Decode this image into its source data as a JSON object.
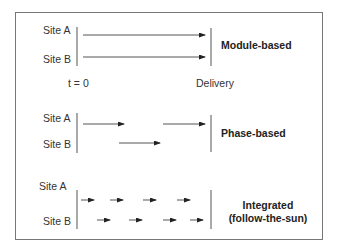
{
  "sections": [
    {
      "title": "Module-based",
      "site_a": "Site A",
      "site_b": "Site B",
      "start_label": "t = 0",
      "end_label": "Delivery"
    },
    {
      "title": "Phase-based",
      "site_a": "Site A",
      "site_b": "Site B"
    },
    {
      "title_line1": "Integrated",
      "title_line2": "(follow-the-sun)",
      "site_a": "Site A",
      "site_b": "Site B"
    }
  ],
  "colors": {
    "line": "#333333",
    "border": "#777777"
  }
}
